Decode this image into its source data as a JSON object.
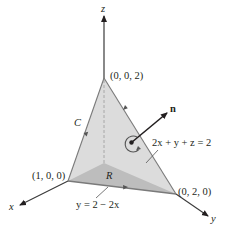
{
  "figure": {
    "axes": {
      "x_label": "x",
      "y_label": "y",
      "z_label": "z"
    },
    "vertices": {
      "apex": "(0, 0, 2)",
      "x_intercept": "(1, 0, 0)",
      "y_intercept": "(0, 2, 0)"
    },
    "labels": {
      "curve": "C",
      "region": "R",
      "normal": "n",
      "plane_equation": "2x + y + z = 2",
      "boundary_line": "y = 2 − 2x"
    },
    "colors": {
      "surface_fill": "#dcdcdc",
      "region_fill": "#bdbdbd",
      "edge": "#7a7a7a",
      "axis": "#3a3a3a",
      "text": "#231f20"
    }
  }
}
